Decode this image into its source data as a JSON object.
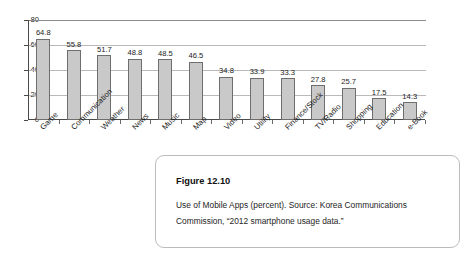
{
  "chart_data": {
    "type": "bar",
    "title": "",
    "xlabel": "",
    "ylabel": "",
    "ylim": [
      0,
      80
    ],
    "yticks": [
      0,
      20,
      40,
      60,
      80
    ],
    "grid": true,
    "legend": "none",
    "bar_color": "#c9c9c9",
    "bar_edge_color": "#6e6e6e",
    "categories": [
      "Game",
      "Communication",
      "Weather",
      "News",
      "Music",
      "Map",
      "Video",
      "Utility",
      "Finance/Stock",
      "TV/Radio",
      "Shopping",
      "Education",
      "e-Book"
    ],
    "values": [
      64.8,
      55.8,
      51.7,
      48.8,
      48.5,
      46.5,
      34.8,
      33.9,
      33.3,
      27.8,
      25.7,
      17.5,
      14.3
    ],
    "value_labels": [
      "64.8",
      "55.8",
      "51.7",
      "48.8",
      "48.5",
      "46.5",
      "34.8",
      "33.9",
      "33.3",
      "27.8",
      "25.7",
      "17.5",
      "14.3"
    ],
    "ytick_labels": [
      "0",
      "20",
      "40",
      "60",
      "80"
    ]
  },
  "caption": {
    "title": "Figure 12.10",
    "body": "Use of Mobile Apps (percent). Source: Korea Communications Commission, “2012 smartphone usage data.”"
  }
}
